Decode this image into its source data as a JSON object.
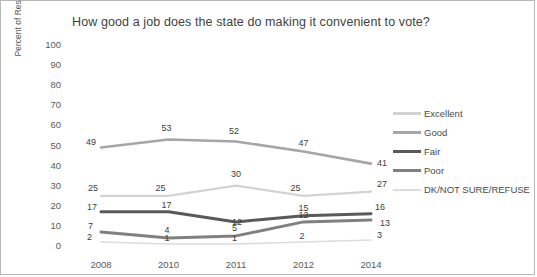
{
  "chart_data": {
    "type": "line",
    "title": "How good a job does the state do making it convenient to vote?",
    "xlabel": "",
    "ylabel": "Percent of Respondents (%)",
    "categories": [
      "2008",
      "2010",
      "2011",
      "2012",
      "2014"
    ],
    "ylim": [
      0,
      100
    ],
    "ytick_step": 10,
    "yticks": [
      "100",
      "90",
      "80",
      "70",
      "60",
      "50",
      "40",
      "30",
      "20",
      "10",
      "0"
    ],
    "grid": false,
    "legend_position": "right",
    "data_labels": true,
    "series": [
      {
        "name": "Excellent",
        "values": [
          25,
          25,
          30,
          25,
          27
        ],
        "color": "#d3d3d3",
        "width": 2.2
      },
      {
        "name": "Good",
        "values": [
          49,
          53,
          52,
          47,
          41
        ],
        "color": "#a6a6a6",
        "width": 2.6
      },
      {
        "name": "Fair",
        "values": [
          17,
          17,
          12,
          15,
          16
        ],
        "color": "#595959",
        "width": 3.0
      },
      {
        "name": "Poor",
        "values": [
          7,
          4,
          5,
          12,
          13
        ],
        "color": "#808080",
        "width": 3.0
      },
      {
        "name": "DK/NOT SURE/REFUSE",
        "values": [
          2,
          1,
          1,
          2,
          3
        ],
        "color": "#dcdcdc",
        "width": 1.6
      }
    ]
  },
  "legend": {
    "items": [
      {
        "label": "Excellent"
      },
      {
        "label": "Good"
      },
      {
        "label": "Fair"
      },
      {
        "label": "Poor"
      },
      {
        "label": "DK/NOT SURE/REFUSE"
      }
    ]
  },
  "frame": {
    "border_color": "#b8b8b8",
    "background": "#ffffff"
  }
}
